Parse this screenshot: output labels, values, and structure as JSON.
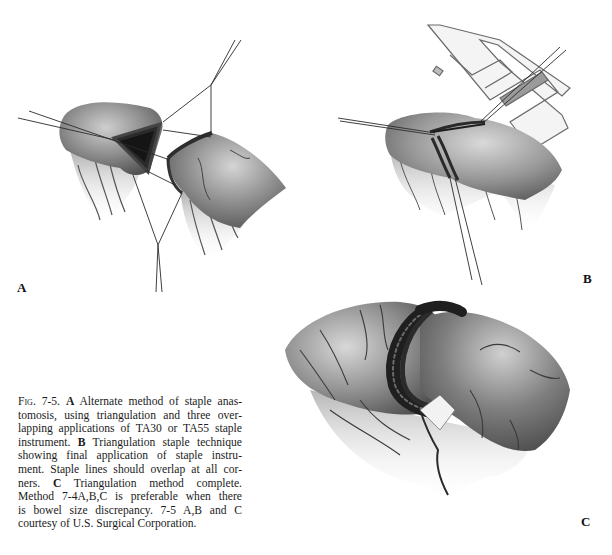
{
  "figure": {
    "panels": [
      {
        "id": "A",
        "label": "A",
        "description": "Two bowel ends held in triangulation with stay sutures, first staple line applied"
      },
      {
        "id": "B",
        "label": "B",
        "description": "Final application of TA staple instrument across triangulated anastomosis"
      },
      {
        "id": "C",
        "label": "C",
        "description": "Completed triangulation anastomosis with overlapping staple lines"
      }
    ],
    "caption": {
      "fig_number": "Fig. 7-5.",
      "lines": [
        {
          "parts": [
            {
              "t": "Fig. 7-5.",
              "style": "figno"
            },
            {
              "t": " "
            },
            {
              "t": "A",
              "style": "bold"
            },
            {
              "t": " Alternate method of staple anas-"
            }
          ]
        },
        {
          "parts": [
            {
              "t": "tomosis, using triangulation and three over-"
            }
          ]
        },
        {
          "parts": [
            {
              "t": "lapping applications of TA30 or TA55 staple"
            }
          ]
        },
        {
          "parts": [
            {
              "t": "instrument. "
            },
            {
              "t": "B",
              "style": "bold"
            },
            {
              "t": " Triangulation staple technique"
            }
          ]
        },
        {
          "parts": [
            {
              "t": "showing final application of staple instru-"
            }
          ]
        },
        {
          "parts": [
            {
              "t": "ment. Staple lines should overlap at all cor-"
            }
          ]
        },
        {
          "parts": [
            {
              "t": "ners. "
            },
            {
              "t": "C",
              "style": "bold"
            },
            {
              "t": " Triangulation method complete."
            }
          ]
        },
        {
          "parts": [
            {
              "t": "Method 7-4A,B,C is preferable when there"
            }
          ]
        },
        {
          "parts": [
            {
              "t": "is bowel size discrepancy. 7-5 A,B and C"
            }
          ]
        },
        {
          "parts": [
            {
              "t": "courtesy of U.S. Surgical Corporation."
            }
          ]
        }
      ]
    }
  },
  "colors": {
    "ink": "#1a1a1a",
    "tissue_dark": "#3a3a3a",
    "tissue_mid": "#8a8a8a",
    "tissue_light": "#d0d0d0",
    "background": "#ffffff"
  }
}
